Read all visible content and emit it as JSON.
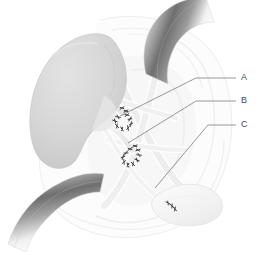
{
  "figure": {
    "name": "kidney-transplant-anastomosis-illustration",
    "background_color": "#ffffff",
    "width": 261,
    "height": 255
  },
  "palette": {
    "background": "#ffffff",
    "kidney_fill": "#d5d5d5",
    "kidney_shadow": "#c2c2c2",
    "kidney_highlight": "#e2e2e2",
    "vessel_pale": "#f1f1f1",
    "vessel_outline": "#e0e0e0",
    "tissue_faint": "#f6f6f6",
    "tissue_shade": "#ededed",
    "retractor_dark": "#6f6f6f",
    "retractor_mid": "#a8a8a8",
    "retractor_light": "#fdfdfd",
    "leader_line": "#6d6d6d",
    "label_text": "#4a4a4a",
    "suture_mark": "#3d3d3d"
  },
  "labels": [
    {
      "id": "label-a",
      "text": "A",
      "text_x": 241,
      "text_y": 78,
      "leader_points": "236,78 196,78 120,116"
    },
    {
      "id": "label-b",
      "text": "B",
      "text_x": 241,
      "text_y": 101,
      "leader_points": "236,101 196,101 128,143"
    },
    {
      "id": "label-c",
      "text": "C",
      "text_x": 241,
      "text_y": 125,
      "leader_points": "236,125 208,125 155,188"
    }
  ],
  "structures": [
    {
      "id": "transplanted-kidney",
      "name": "transplanted kidney"
    },
    {
      "id": "renal-artery-anastomosis",
      "name": "renal artery anastomosis"
    },
    {
      "id": "renal-vein-anastomosis",
      "name": "renal vein anastomosis"
    },
    {
      "id": "ureteroneocystostomy",
      "name": "ureter to bladder anastomosis"
    },
    {
      "id": "urinary-bladder",
      "name": "urinary bladder"
    },
    {
      "id": "iliac-vessels",
      "name": "iliac vessels"
    },
    {
      "id": "retractor-upper",
      "name": "upper surgical retractor"
    },
    {
      "id": "retractor-lower",
      "name": "lower surgical retractor"
    }
  ],
  "suture_groups": [
    {
      "id": "suture-cluster-artery",
      "marks": [
        {
          "x": 122,
          "y": 108,
          "r": -35
        },
        {
          "x": 126,
          "y": 111,
          "r": -30
        },
        {
          "x": 118,
          "y": 117,
          "r": 10
        },
        {
          "x": 115,
          "y": 121,
          "r": 20
        },
        {
          "x": 117,
          "y": 126,
          "r": 45
        },
        {
          "x": 122,
          "y": 129,
          "r": 60
        },
        {
          "x": 128,
          "y": 128,
          "r": 80
        },
        {
          "x": 131,
          "y": 124,
          "r": 100
        },
        {
          "x": 130,
          "y": 119,
          "r": 120
        },
        {
          "x": 127,
          "y": 115,
          "r": 140
        }
      ]
    },
    {
      "id": "suture-cluster-vein",
      "marks": [
        {
          "x": 135,
          "y": 146,
          "r": -30
        },
        {
          "x": 138,
          "y": 150,
          "r": -20
        },
        {
          "x": 139,
          "y": 155,
          "r": 5
        },
        {
          "x": 137,
          "y": 160,
          "r": 25
        },
        {
          "x": 133,
          "y": 164,
          "r": 45
        },
        {
          "x": 128,
          "y": 165,
          "r": 65
        },
        {
          "x": 124,
          "y": 162,
          "r": 85
        },
        {
          "x": 123,
          "y": 157,
          "r": 105
        },
        {
          "x": 126,
          "y": 153,
          "r": 125
        },
        {
          "x": 130,
          "y": 149,
          "r": 145
        }
      ]
    },
    {
      "id": "suture-cluster-bladder",
      "marks": [
        {
          "x": 168,
          "y": 203,
          "r": 30
        },
        {
          "x": 172,
          "y": 206,
          "r": 40
        },
        {
          "x": 175,
          "y": 209,
          "r": 50
        }
      ]
    }
  ]
}
